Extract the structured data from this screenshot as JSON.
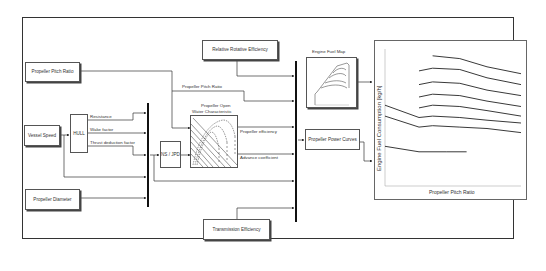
{
  "diagram": {
    "blocks": {
      "propeller_pitch_ratio": "Propeller Pitch Ratio",
      "vessel_speed": "Vessel Speed",
      "hull": "HULL",
      "propeller_diameter": "Propeller Diameter",
      "relative_rotative_efficiency": "Relative Rotative Efficiency",
      "transmission_efficiency": "Transmission Efficiency",
      "ns_jpd": "NS / JPD",
      "propeller_open_water_title_line1": "Propeller Open",
      "propeller_open_water_title_line2": "Water Characteristic",
      "engine_fuel_map_title": "Engine Fuel Map",
      "propeller_power_curves": "Propeller Power Curves"
    },
    "signals": {
      "resistance": "Resistance",
      "wake_factor": "Wake factor",
      "thrust_deduction_factor": "Thrust deduction factor",
      "propeller_pitch_ratio_line": "Propeller Pitch Ratio",
      "propeller_efficiency": "Propeller efficiency",
      "advance_coefficient": "Advance coefficient"
    },
    "output_chart": {
      "ylabel": "Engine Fuel Consumption [kg/h]",
      "xlabel": "Propeller Pitch Ratio"
    }
  },
  "chart_data": {
    "type": "line",
    "title": "",
    "xlabel": "Propeller Pitch Ratio",
    "ylabel": "Engine Fuel Consumption [kg/h]",
    "grid": false,
    "legend": null,
    "series": [
      {
        "name": "curve-1",
        "points": [
          [
            0.35,
            0.95
          ],
          [
            0.55,
            0.93
          ],
          [
            0.75,
            0.87
          ],
          [
            1.0,
            0.82
          ]
        ]
      },
      {
        "name": "curve-2",
        "points": [
          [
            0.25,
            0.84
          ],
          [
            0.35,
            0.86
          ],
          [
            0.55,
            0.85
          ],
          [
            0.75,
            0.79
          ],
          [
            1.0,
            0.74
          ]
        ]
      },
      {
        "name": "curve-3",
        "points": [
          [
            0.25,
            0.74
          ],
          [
            0.35,
            0.76
          ],
          [
            0.55,
            0.75
          ],
          [
            0.75,
            0.7
          ],
          [
            1.0,
            0.66
          ]
        ]
      },
      {
        "name": "curve-4",
        "points": [
          [
            0.25,
            0.65
          ],
          [
            0.35,
            0.67
          ],
          [
            0.55,
            0.66
          ],
          [
            0.75,
            0.62
          ],
          [
            1.0,
            0.58
          ]
        ]
      },
      {
        "name": "curve-5",
        "points": [
          [
            0.25,
            0.57
          ],
          [
            0.35,
            0.59
          ],
          [
            0.55,
            0.58
          ],
          [
            0.75,
            0.55
          ],
          [
            1.0,
            0.51
          ]
        ]
      },
      {
        "name": "curve-6",
        "points": [
          [
            0.0,
            0.59
          ],
          [
            0.25,
            0.5
          ],
          [
            0.35,
            0.51
          ],
          [
            0.55,
            0.5
          ],
          [
            0.75,
            0.48
          ],
          [
            1.0,
            0.46
          ]
        ]
      },
      {
        "name": "curve-7",
        "points": [
          [
            0.0,
            0.51
          ],
          [
            0.25,
            0.43
          ],
          [
            0.35,
            0.44
          ],
          [
            0.55,
            0.43
          ],
          [
            0.75,
            0.42
          ],
          [
            1.0,
            0.39
          ]
        ]
      },
      {
        "name": "curve-8",
        "points": [
          [
            0.0,
            0.29
          ],
          [
            0.25,
            0.25
          ],
          [
            0.45,
            0.25
          ],
          [
            0.6,
            0.25
          ]
        ]
      }
    ],
    "xlim": [
      0,
      1
    ],
    "ylim": [
      0,
      1
    ]
  }
}
